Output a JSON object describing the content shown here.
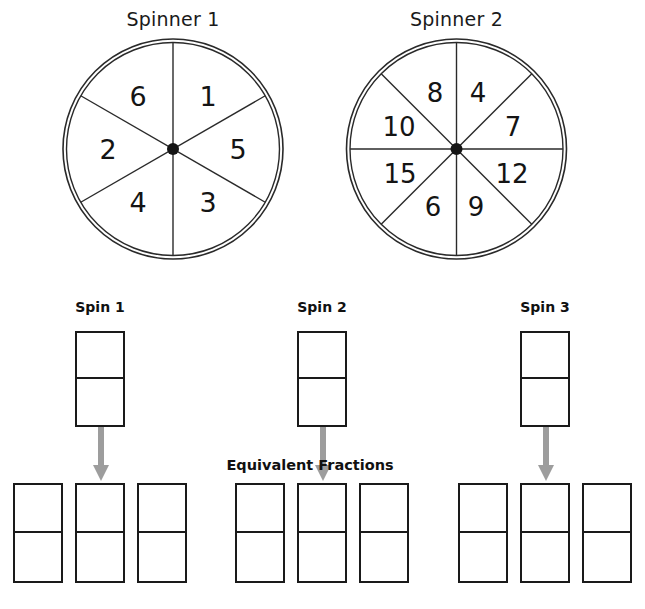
{
  "page": {
    "background_color": "#ffffff",
    "ink_color": "#1a1a1a",
    "arrow_color": "#9d9d9d"
  },
  "spinners": [
    {
      "title": "Spinner 1",
      "sector_count": 6,
      "center": {
        "x": 173,
        "y": 150
      },
      "radius": 111,
      "sectors": [
        {
          "label": "1",
          "start_deg": -90,
          "end_deg": -30
        },
        {
          "label": "5",
          "start_deg": -30,
          "end_deg": 30
        },
        {
          "label": "3",
          "start_deg": 30,
          "end_deg": 90
        },
        {
          "label": "4",
          "start_deg": 90,
          "end_deg": 150
        },
        {
          "label": "2",
          "start_deg": 150,
          "end_deg": 210
        },
        {
          "label": "6",
          "start_deg": 210,
          "end_deg": 270
        }
      ],
      "labels_clockwise_from_top": [
        "1",
        "5",
        "3",
        "4",
        "2",
        "6"
      ]
    },
    {
      "title": "Spinner 2",
      "sector_count": 8,
      "center": {
        "x": 456,
        "y": 150
      },
      "radius": 111,
      "sectors": [
        {
          "label": "4",
          "start_deg": -90,
          "end_deg": -45
        },
        {
          "label": "7",
          "start_deg": -45,
          "end_deg": 0
        },
        {
          "label": "12",
          "start_deg": 0,
          "end_deg": 45
        },
        {
          "label": "9",
          "start_deg": 45,
          "end_deg": 90
        },
        {
          "label": "6",
          "start_deg": 90,
          "end_deg": 135
        },
        {
          "label": "15",
          "start_deg": 135,
          "end_deg": 180
        },
        {
          "label": "10",
          "start_deg": 180,
          "end_deg": 225
        },
        {
          "label": "8",
          "start_deg": 225,
          "end_deg": 270
        }
      ],
      "labels_clockwise_from_top": [
        "4",
        "7",
        "12",
        "9",
        "6",
        "15",
        "10",
        "8"
      ]
    }
  ],
  "spins": [
    {
      "label": "Spin 1",
      "fraction": {
        "numerator": "",
        "denominator": ""
      },
      "equivalents": [
        {
          "numerator": "",
          "denominator": ""
        },
        {
          "numerator": "",
          "denominator": ""
        },
        {
          "numerator": "",
          "denominator": ""
        }
      ]
    },
    {
      "label": "Spin 2",
      "fraction": {
        "numerator": "",
        "denominator": ""
      },
      "equivalents": [
        {
          "numerator": "",
          "denominator": ""
        },
        {
          "numerator": "",
          "denominator": ""
        },
        {
          "numerator": "",
          "denominator": ""
        }
      ]
    },
    {
      "label": "Spin 3",
      "fraction": {
        "numerator": "",
        "denominator": ""
      },
      "equivalents": [
        {
          "numerator": "",
          "denominator": ""
        },
        {
          "numerator": "",
          "denominator": ""
        },
        {
          "numerator": "",
          "denominator": ""
        }
      ]
    }
  ],
  "equivalent_fractions": {
    "title": "Equivalent Fractions"
  },
  "bottom_note": {
    "text": ""
  }
}
